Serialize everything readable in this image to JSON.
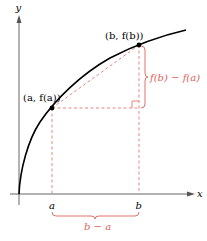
{
  "diagram": {
    "type": "mean-value-secant-figure",
    "axes": {
      "x_label": "x",
      "y_label": "y"
    },
    "points": {
      "a_label": "(a, f(a))",
      "b_label": "(b, f(b))"
    },
    "ticks": {
      "a": "a",
      "b": "b"
    },
    "brackets": {
      "vertical_label": "f(b) − f(a)",
      "horizontal_label": "b − a"
    },
    "colors": {
      "curve": "#000000",
      "axis": "#555555",
      "accent": "#e0625a",
      "dashed": "#e07b76"
    }
  }
}
